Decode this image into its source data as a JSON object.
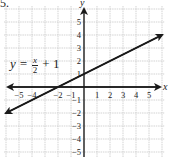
{
  "problem": {
    "number": "5."
  },
  "chart_data": {
    "type": "line",
    "title": "",
    "equation": "y = x/2 + 1",
    "equation_label": {
      "lhs": "y =",
      "num": "x",
      "den": "2",
      "rhs": "+ 1"
    },
    "xlabel": "x",
    "ylabel": "y",
    "xlim": [
      -6,
      6
    ],
    "ylim": [
      -5.5,
      6
    ],
    "x_ticks": [
      -5,
      -4,
      -2,
      -1,
      1,
      2,
      3,
      4,
      5
    ],
    "x_tick_labels": [
      "−5",
      "−4",
      "−2",
      "−1",
      "1",
      "2",
      "3",
      "4",
      "5"
    ],
    "y_ticks": [
      5,
      4,
      3,
      2,
      1,
      -1,
      -2,
      -3,
      -4,
      -5
    ],
    "y_tick_labels": [
      "5",
      "4",
      "3",
      "2",
      "1",
      "−1",
      "−2",
      "−3",
      "−4",
      "−5"
    ],
    "grid": true,
    "series": [
      {
        "name": "y = x/2 + 1",
        "x": [
          -6,
          -2,
          0,
          2,
          6
        ],
        "y": [
          -2,
          0,
          1,
          2,
          4
        ],
        "arrows": "both"
      }
    ]
  },
  "colors": {
    "axis": "#1a1a1a",
    "grid": "#c8c8c8",
    "line": "#1a1a1a",
    "text": "#222222"
  }
}
